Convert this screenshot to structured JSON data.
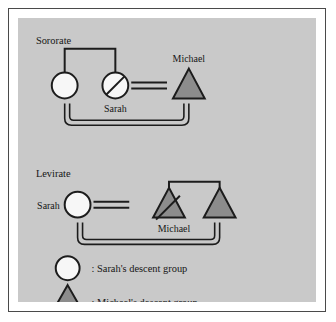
{
  "figure": {
    "background_color": "#c9c9c9",
    "frame_color": "#4a4a4a",
    "page_color": "#ffffff",
    "line_color": "#1c1c1c",
    "female_fill": "#f7f7f7",
    "male_fill": "#8c8c8c"
  },
  "sororate": {
    "title": "Sororate",
    "sister_label": "",
    "deceased_wife_label": "Sarah",
    "husband_label": "Michael",
    "nodes": [
      {
        "id": "sister",
        "shape": "circle",
        "label": "",
        "deceased": false,
        "group": "sarah"
      },
      {
        "id": "sarah",
        "shape": "circle",
        "label": "Sarah",
        "deceased": true,
        "group": "sarah"
      },
      {
        "id": "michael",
        "shape": "triangle",
        "label": "Michael",
        "deceased": false,
        "group": "michael"
      }
    ],
    "sibling_link": "sister-sarah",
    "marriage_link": "sarah-michael",
    "descent_bracket": "sister-michael"
  },
  "levirate": {
    "title": "Levirate",
    "wife_label": "Sarah",
    "deceased_husband_label": "Michael",
    "brother_label": "",
    "nodes": [
      {
        "id": "sarah",
        "shape": "circle",
        "label": "Sarah",
        "deceased": false,
        "group": "sarah"
      },
      {
        "id": "michael",
        "shape": "triangle",
        "label": "Michael",
        "deceased": true,
        "group": "michael"
      },
      {
        "id": "brother",
        "shape": "triangle",
        "label": "",
        "deceased": false,
        "group": "michael"
      }
    ],
    "sibling_link": "michael-brother",
    "marriage_link": "sarah-michael",
    "descent_bracket": "sarah-brother"
  },
  "legend": {
    "items": [
      {
        "symbol": "circle",
        "separator": ":",
        "label": "Sarah's descent group"
      },
      {
        "symbol": "triangle",
        "separator": ":",
        "label": "Michael's descent group"
      }
    ],
    "circle_text": ": Sarah's descent group",
    "triangle_text": ": Michael's descent group"
  }
}
